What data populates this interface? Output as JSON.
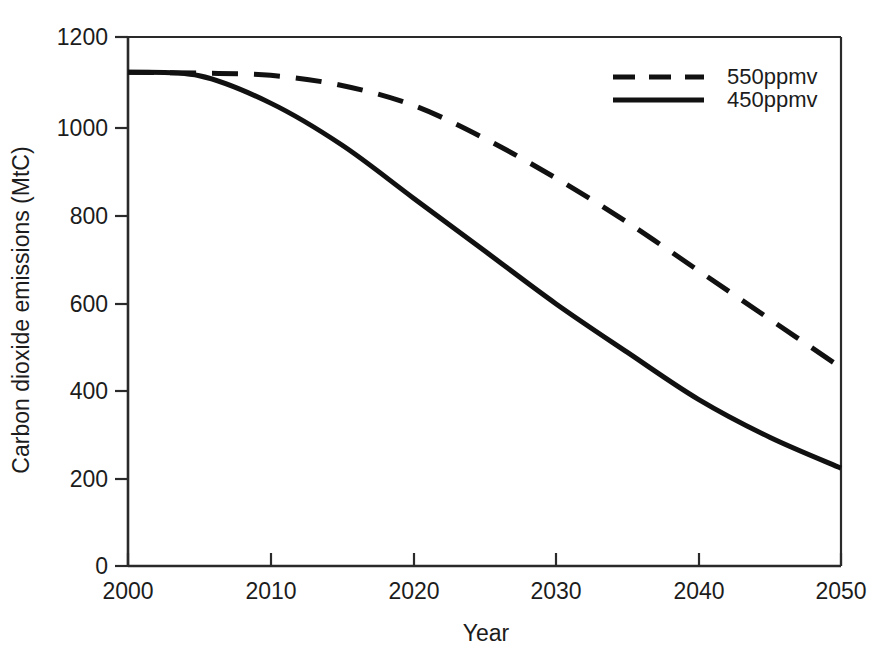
{
  "chart_data": {
    "type": "line",
    "title": "",
    "xlabel": "Year",
    "ylabel": "Carbon dioxide emissions (MtC)",
    "xlim": [
      2000,
      2050
    ],
    "ylim": [
      0,
      1200
    ],
    "xticks": [
      "2000",
      "2010",
      "2020",
      "2030",
      "2040",
      "2050"
    ],
    "xtick_values": [
      2000,
      2010,
      2020,
      2030,
      2040,
      2050
    ],
    "yticks": [
      "0",
      "200",
      "400",
      "600",
      "800",
      "1000",
      "1200"
    ],
    "ytick_values": [
      0,
      200,
      400,
      600,
      800,
      1000,
      1200
    ],
    "grid": false,
    "legend_position": "top-right",
    "x": [
      2000,
      2005,
      2010,
      2015,
      2020,
      2025,
      2030,
      2035,
      2040,
      2045,
      2050
    ],
    "series": [
      {
        "name": "550ppmv",
        "style": "dashed",
        "color": "#111111",
        "values": [
          1120,
          1118,
          1113,
          1090,
          1045,
          970,
          880,
          780,
          670,
          560,
          450
        ]
      },
      {
        "name": "450ppmv",
        "style": "solid",
        "color": "#111111",
        "values": [
          1120,
          1112,
          1050,
          955,
          835,
          715,
          595,
          485,
          378,
          292,
          222
        ]
      }
    ]
  },
  "axes": {
    "y_title": "Carbon dioxide emissions (MtC)",
    "x_title": "Year",
    "y_tick_labels": [
      "1200",
      "1000",
      "800",
      "600",
      "400",
      "200",
      "0"
    ],
    "x_tick_labels": [
      "2000",
      "2010",
      "2020",
      "2030",
      "2040",
      "2050"
    ]
  },
  "legend": {
    "entries": [
      {
        "label": "550ppmv",
        "style": "dashed"
      },
      {
        "label": "450ppmv",
        "style": "solid"
      }
    ]
  },
  "colors": {
    "line": "#111111",
    "axis": "#2a2a2a",
    "background": "#ffffff",
    "text": "#1c1c1c"
  }
}
